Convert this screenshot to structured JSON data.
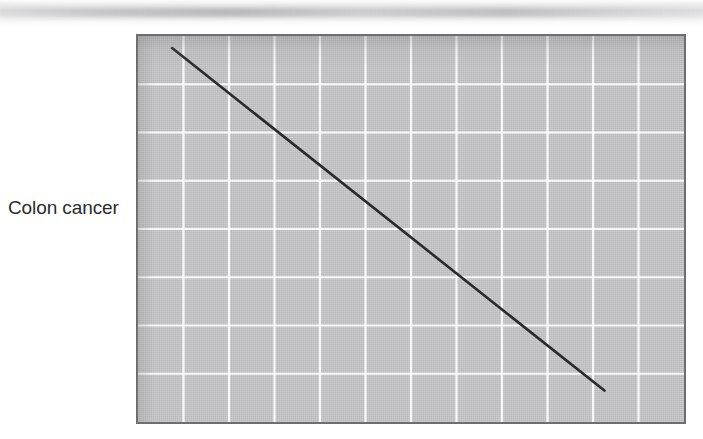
{
  "figure": {
    "row_label": "Colon cancer",
    "background_color": "#ffffff",
    "plot_fill_color": "#c6c6c8",
    "grid_color": "#fdfdfd",
    "border_color": "#6e6e70",
    "line_color": "#2a2a2c"
  },
  "chart_data": {
    "type": "line",
    "title": "",
    "subtitle": "",
    "xlabel": "",
    "ylabel": "Colon cancer",
    "annotations": [],
    "legend": [],
    "legend_position": "none",
    "grid": true,
    "grid_columns": 12,
    "grid_rows": 8,
    "xlim": [
      0,
      12
    ],
    "ylim": [
      0,
      8
    ],
    "xticklabels": [],
    "yticklabels": [],
    "series": [
      {
        "name": "Colon cancer",
        "x": [
          0.75,
          10.25
        ],
        "y": [
          7.75,
          0.65
        ],
        "description": "Single straight descending line from upper-left to lower-right"
      }
    ]
  }
}
